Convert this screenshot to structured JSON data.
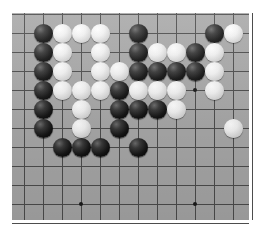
{
  "app": {
    "title": "Go Board",
    "board_label": "go-board",
    "background_color": "#ffffff"
  },
  "board": {
    "surface_color": "#a9a9a9",
    "line_color": "#4d4d4d",
    "star_color": "#1a1a1a",
    "black_stone_color": "#000000",
    "white_stone_color": "#f2f2f2",
    "columns": 13,
    "rows": 11,
    "cell_size": 19,
    "origin_x": 12,
    "origin_y": 13,
    "stone_diameter": 19,
    "surface_width": 237,
    "surface_height": 207,
    "grid_left": 12,
    "grid_top": 14,
    "star_points": [
      {
        "col": 10,
        "row": 4,
        "name": "star-point-upper-right"
      },
      {
        "col": 4,
        "row": 10,
        "name": "star-point-lower-left"
      },
      {
        "col": 10,
        "row": 10,
        "name": "star-point-lower-right"
      }
    ]
  },
  "chart_data": {
    "type": "table",
    "xlabel": "column",
    "ylabel": "row",
    "grid": true,
    "legend": [
      "black stone",
      "white stone"
    ],
    "columns": 13,
    "rows": 11,
    "stones": [
      {
        "col": 2,
        "row": 1,
        "color": "black"
      },
      {
        "col": 3,
        "row": 1,
        "color": "white"
      },
      {
        "col": 4,
        "row": 1,
        "color": "white"
      },
      {
        "col": 5,
        "row": 1,
        "color": "white"
      },
      {
        "col": 7,
        "row": 1,
        "color": "black"
      },
      {
        "col": 11,
        "row": 1,
        "color": "black"
      },
      {
        "col": 12,
        "row": 1,
        "color": "white"
      },
      {
        "col": 2,
        "row": 2,
        "color": "black"
      },
      {
        "col": 3,
        "row": 2,
        "color": "white"
      },
      {
        "col": 5,
        "row": 2,
        "color": "white"
      },
      {
        "col": 7,
        "row": 2,
        "color": "black"
      },
      {
        "col": 8,
        "row": 2,
        "color": "white"
      },
      {
        "col": 9,
        "row": 2,
        "color": "white"
      },
      {
        "col": 10,
        "row": 2,
        "color": "black"
      },
      {
        "col": 11,
        "row": 2,
        "color": "white"
      },
      {
        "col": 2,
        "row": 3,
        "color": "black"
      },
      {
        "col": 3,
        "row": 3,
        "color": "white"
      },
      {
        "col": 5,
        "row": 3,
        "color": "white"
      },
      {
        "col": 6,
        "row": 3,
        "color": "white"
      },
      {
        "col": 7,
        "row": 3,
        "color": "black"
      },
      {
        "col": 8,
        "row": 3,
        "color": "black"
      },
      {
        "col": 9,
        "row": 3,
        "color": "black"
      },
      {
        "col": 10,
        "row": 3,
        "color": "black"
      },
      {
        "col": 11,
        "row": 3,
        "color": "white"
      },
      {
        "col": 2,
        "row": 4,
        "color": "black"
      },
      {
        "col": 3,
        "row": 4,
        "color": "white"
      },
      {
        "col": 4,
        "row": 4,
        "color": "white"
      },
      {
        "col": 5,
        "row": 4,
        "color": "white"
      },
      {
        "col": 6,
        "row": 4,
        "color": "black"
      },
      {
        "col": 7,
        "row": 4,
        "color": "white"
      },
      {
        "col": 8,
        "row": 4,
        "color": "white"
      },
      {
        "col": 9,
        "row": 4,
        "color": "white"
      },
      {
        "col": 11,
        "row": 4,
        "color": "white"
      },
      {
        "col": 2,
        "row": 5,
        "color": "black"
      },
      {
        "col": 4,
        "row": 5,
        "color": "white"
      },
      {
        "col": 6,
        "row": 5,
        "color": "black"
      },
      {
        "col": 7,
        "row": 5,
        "color": "black"
      },
      {
        "col": 8,
        "row": 5,
        "color": "black"
      },
      {
        "col": 9,
        "row": 5,
        "color": "white"
      },
      {
        "col": 2,
        "row": 6,
        "color": "black"
      },
      {
        "col": 4,
        "row": 6,
        "color": "white"
      },
      {
        "col": 6,
        "row": 6,
        "color": "black"
      },
      {
        "col": 12,
        "row": 6,
        "color": "white"
      },
      {
        "col": 3,
        "row": 7,
        "color": "black"
      },
      {
        "col": 4,
        "row": 7,
        "color": "black"
      },
      {
        "col": 5,
        "row": 7,
        "color": "black"
      },
      {
        "col": 7,
        "row": 7,
        "color": "black"
      }
    ]
  }
}
